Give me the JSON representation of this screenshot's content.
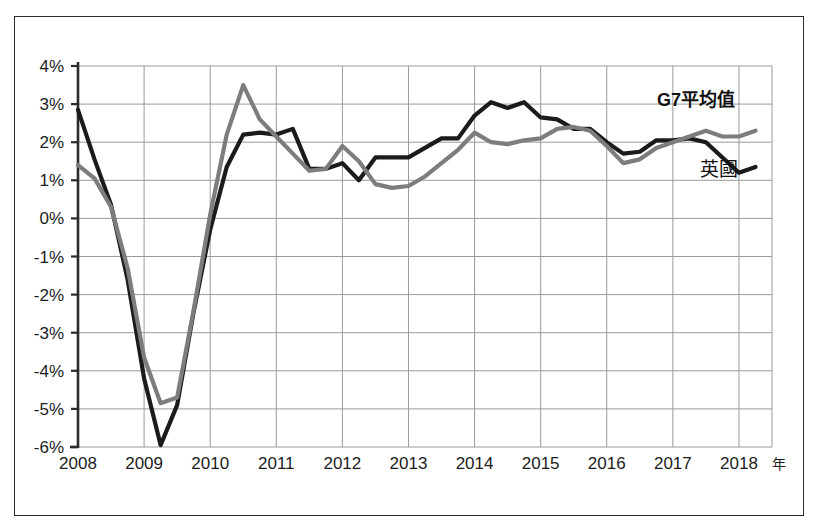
{
  "figure": {
    "has_outer_border": true,
    "background_color": "#ffffff"
  },
  "chart_data": {
    "type": "line",
    "title": "",
    "subtitle": "",
    "xlabel": "年",
    "ylabel": "",
    "grid": true,
    "legend_position": "inline-right",
    "xlim": [
      2008.0,
      2018.5
    ],
    "ylim": [
      -6,
      4
    ],
    "y_tick_labels": [
      "4%",
      "3%",
      "2%",
      "1%",
      "0%",
      "-1%",
      "-2%",
      "-3%",
      "-4%",
      "-5%",
      "-6%"
    ],
    "y_tick_values": [
      4,
      3,
      2,
      1,
      0,
      -1,
      -2,
      -3,
      -4,
      -5,
      -6
    ],
    "x_tick_labels": [
      "2008",
      "2009",
      "2010",
      "2011",
      "2012",
      "2013",
      "2014",
      "2015",
      "2016",
      "2017",
      "2018"
    ],
    "x_tick_values": [
      2008,
      2009,
      2010,
      2011,
      2012,
      2013,
      2014,
      2015,
      2016,
      2017,
      2018
    ],
    "x_unit_label": "年",
    "series": [
      {
        "name": "英國",
        "color": "#1b1b1b",
        "stroke_width": 4.2,
        "label_x": 2017.7,
        "label_y": 1.12,
        "x": [
          2008.0,
          2008.25,
          2008.5,
          2008.75,
          2009.0,
          2009.25,
          2009.5,
          2009.75,
          2010.0,
          2010.25,
          2010.5,
          2010.75,
          2011.0,
          2011.25,
          2011.5,
          2011.75,
          2012.0,
          2012.25,
          2012.5,
          2012.75,
          2013.0,
          2013.25,
          2013.5,
          2013.75,
          2014.0,
          2014.25,
          2014.5,
          2014.75,
          2015.0,
          2015.25,
          2015.5,
          2015.75,
          2016.0,
          2016.25,
          2016.5,
          2016.75,
          2017.0,
          2017.25,
          2017.5,
          2017.75,
          2018.0,
          2018.25
        ],
        "y": [
          2.85,
          1.55,
          0.35,
          -1.6,
          -4.2,
          -5.95,
          -4.9,
          -2.45,
          -0.3,
          1.35,
          2.2,
          2.25,
          2.2,
          2.35,
          1.3,
          1.3,
          1.45,
          1.0,
          1.6,
          1.6,
          1.6,
          1.85,
          2.1,
          2.1,
          2.7,
          3.05,
          2.9,
          3.05,
          2.65,
          2.6,
          2.35,
          2.35,
          2.0,
          1.7,
          1.75,
          2.05,
          2.05,
          2.1,
          2.0,
          1.6,
          1.2,
          1.35
        ]
      },
      {
        "name": "G7平均值",
        "color": "#7d7d7d",
        "stroke_width": 4.2,
        "label_x": 2017.35,
        "label_y": 2.95,
        "x": [
          2008.0,
          2008.25,
          2008.5,
          2008.75,
          2009.0,
          2009.25,
          2009.5,
          2009.75,
          2010.0,
          2010.25,
          2010.5,
          2010.75,
          2011.0,
          2011.25,
          2011.5,
          2011.75,
          2012.0,
          2012.25,
          2012.5,
          2012.75,
          2013.0,
          2013.25,
          2013.5,
          2013.75,
          2014.0,
          2014.25,
          2014.5,
          2014.75,
          2015.0,
          2015.25,
          2015.5,
          2015.75,
          2016.0,
          2016.25,
          2016.5,
          2016.75,
          2017.0,
          2017.25,
          2017.5,
          2017.75,
          2018.0,
          2018.25
        ],
        "y": [
          1.4,
          1.05,
          0.3,
          -1.3,
          -3.65,
          -4.85,
          -4.7,
          -2.4,
          0.1,
          2.2,
          3.5,
          2.6,
          2.15,
          1.7,
          1.25,
          1.3,
          1.9,
          1.5,
          0.9,
          0.8,
          0.85,
          1.1,
          1.45,
          1.8,
          2.25,
          2.0,
          1.95,
          2.05,
          2.1,
          2.35,
          2.4,
          2.3,
          1.9,
          1.45,
          1.55,
          1.85,
          2.0,
          2.15,
          2.3,
          2.15,
          2.15,
          2.3
        ]
      }
    ]
  }
}
